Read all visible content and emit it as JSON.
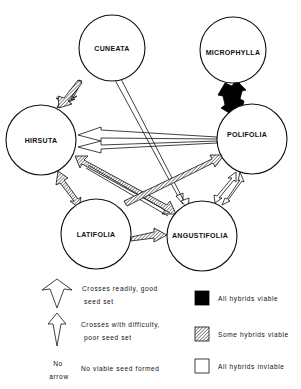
{
  "nodes": [
    {
      "id": "cuneata",
      "label": "CUNEATA",
      "cx": 112,
      "cy": 48,
      "r": 33
    },
    {
      "id": "microphylla",
      "label": "MICROPHYLLA",
      "cx": 233,
      "cy": 50,
      "r": 33
    },
    {
      "id": "hirsuta",
      "label": "HIRSUTA",
      "cx": 41,
      "cy": 140,
      "r": 35
    },
    {
      "id": "polifolia",
      "label": "POLIFOLIA",
      "cx": 252,
      "cy": 139,
      "r": 35
    },
    {
      "id": "latifolia",
      "label": "LATIFOLIA",
      "cx": 96,
      "cy": 234,
      "r": 35
    },
    {
      "id": "angustifolia",
      "label": "ANGUSTIFOLIA",
      "cx": 202,
      "cy": 236,
      "r": 35
    }
  ],
  "edges": [
    {
      "from": "cuneata",
      "to": "hirsuta",
      "crossing": "readily",
      "hybrids": "some viable"
    },
    {
      "from": "microphylla",
      "to": "polifolia",
      "crossing": "readily",
      "hybrids": "all viable",
      "bidirectional": true
    },
    {
      "from": "polifolia",
      "to": "hirsuta",
      "crossing": "readily",
      "hybrids": "all inviable",
      "count": 2
    },
    {
      "from": "cuneata",
      "to": "angustifolia",
      "crossing": "with difficulty",
      "hybrids": "all inviable",
      "count": 2
    },
    {
      "from": "hirsuta",
      "to": "angustifolia",
      "crossing": "readily",
      "hybrids": "some viable",
      "bidirectional": true
    },
    {
      "from": "hirsuta",
      "to": "latifolia",
      "crossing": "readily",
      "hybrids": "some viable",
      "bidirectional": true
    },
    {
      "from": "latifolia",
      "to": "polifolia",
      "crossing": "readily",
      "hybrids": "some viable"
    },
    {
      "from": "latifolia",
      "to": "angustifolia",
      "crossing": "readily",
      "hybrids": "some viable"
    },
    {
      "from": "polifolia",
      "to": "angustifolia",
      "crossing": "with difficulty",
      "hybrids": "all inviable",
      "bidirectional": true
    }
  ],
  "legend": {
    "arrows": [
      {
        "label_line1": "Crosses readily, good",
        "label_line2": "seed set"
      },
      {
        "label_line1": "Crosses with difficulty,",
        "label_line2": "poor seed set"
      },
      {
        "symbol_line1": "No",
        "symbol_line2": "arrow",
        "label_line1": "No viable seed formed"
      }
    ],
    "fills": [
      {
        "label": "All hybrids viable",
        "fill": "#000000"
      },
      {
        "label": "Some hybrids viable",
        "fill": "hatch"
      },
      {
        "label": "All hybrids inviable",
        "fill": "#ffffff"
      }
    ]
  }
}
